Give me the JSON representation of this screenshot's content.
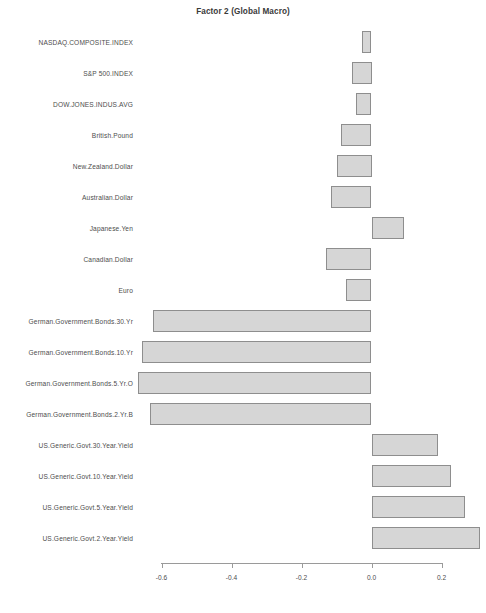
{
  "chart_data": {
    "type": "bar",
    "orientation": "horizontal",
    "title": "Factor 2 (Global Macro)",
    "xlabel": "",
    "ylabel": "",
    "xlim": [
      -0.7,
      0.32
    ],
    "grid": false,
    "legend": null,
    "xticks": [
      -0.6,
      -0.4,
      -0.2,
      0.0,
      0.2
    ],
    "xtick_labels": [
      "-0.6",
      "-0.4",
      "-0.2",
      "0.0",
      "0.2"
    ],
    "bar_fill_color": "#d6d6d6",
    "bar_border_color": "#8e8e8e",
    "categories": [
      "NASDAQ.COMPOSITE.INDEX",
      "S&P 500.INDEX",
      "DOW.JONES.INDUS.AVG",
      "British.Pound",
      "New.Zealand.Dollar",
      "Australian.Dollar",
      "Japanese.Yen",
      "Canadian.Dollar",
      "Euro",
      "German.Government.Bonds.30.Yr",
      "German.Government.Bonds.10.Yr",
      "German.Government.Bonds.5.Yr.O",
      "German.Government.Bonds.2.Yr.B",
      "US.Generic.Govt.30.Year.Yield",
      "US.Generic.Govt.10.Year.Yield",
      "US.Generic.Govt.5.Year.Yield",
      "US.Generic.Govt.2.Year.Yield"
    ],
    "values": [
      -0.026,
      -0.055,
      -0.043,
      -0.088,
      -0.1,
      -0.117,
      0.092,
      -0.131,
      -0.074,
      -0.623,
      -0.657,
      -0.666,
      -0.632,
      0.191,
      0.228,
      0.266,
      0.311
    ]
  },
  "footer": {
    "text": ""
  }
}
